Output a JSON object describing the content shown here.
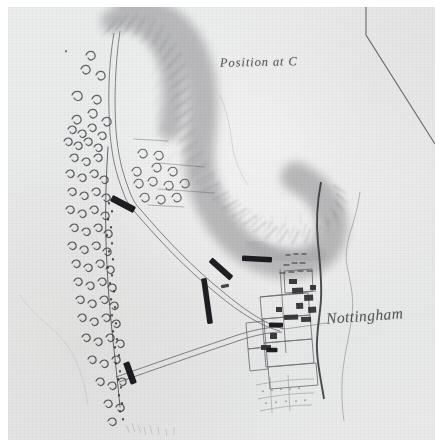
{
  "document": {
    "kind": "hand-drawn-manuscript-map",
    "medium": "pen-and-ink-with-wash",
    "sheet_background": "#ffffff",
    "paper_tone": "#eaebeb",
    "ink_color": "#3a3a3c",
    "wash_color": "#9a9a9c"
  },
  "labels": {
    "title": "Position at C",
    "town": "Nottingham"
  },
  "map": {
    "features": [
      {
        "name": "ridge-hachure-shading",
        "type": "terrain-relief",
        "description": "hook-shaped hill ridge running from top centre down to right of centre"
      },
      {
        "name": "woodland-belt",
        "type": "vegetation",
        "description": "dense tree symbols along the left side of the sheet"
      },
      {
        "name": "scattered-trees-upper-left",
        "type": "vegetation",
        "description": "sparse tree symbols in the upper left"
      },
      {
        "name": "scattered-trees-centre",
        "type": "vegetation",
        "description": "sparse tree symbols below the ridge crest"
      },
      {
        "name": "main-road-north",
        "type": "road",
        "description": "road running north past the ridge toe"
      },
      {
        "name": "road-to-town",
        "type": "road",
        "description": "road running south-east into the town"
      },
      {
        "name": "lower-road",
        "type": "road",
        "description": "road running from the lower left to the town"
      },
      {
        "name": "river",
        "type": "watercourse",
        "description": "dark sinuous watercourse passing through the town"
      },
      {
        "name": "stream",
        "type": "watercourse",
        "description": "faint stream to the east of the river"
      },
      {
        "name": "sheet-boundary-line",
        "type": "boundary",
        "description": "ruled line in the upper right corner"
      },
      {
        "name": "town-blocks",
        "type": "settlement",
        "description": "building blocks and enclosures of the town"
      },
      {
        "name": "field-enclosures",
        "type": "field",
        "description": "faint field boundaries south of the town"
      }
    ],
    "troop_markers": [
      {
        "name": "troop-marker-1",
        "x": 115,
        "y": 197,
        "length": 26,
        "angle": 28
      },
      {
        "name": "troop-marker-2",
        "x": 213,
        "y": 262,
        "length": 28,
        "angle": 42
      },
      {
        "name": "troop-marker-3",
        "x": 199,
        "y": 294,
        "length": 46,
        "angle": 82
      },
      {
        "name": "troop-marker-4",
        "x": 249,
        "y": 252,
        "length": 30,
        "angle": 3
      },
      {
        "name": "troop-marker-5",
        "x": 122,
        "y": 366,
        "length": 23,
        "angle": 70
      },
      {
        "name": "troop-marker-6",
        "x": 268,
        "y": 318,
        "length": 14,
        "angle": 2
      },
      {
        "name": "troop-marker-7",
        "x": 264,
        "y": 343,
        "length": 11,
        "angle": 0
      }
    ]
  }
}
